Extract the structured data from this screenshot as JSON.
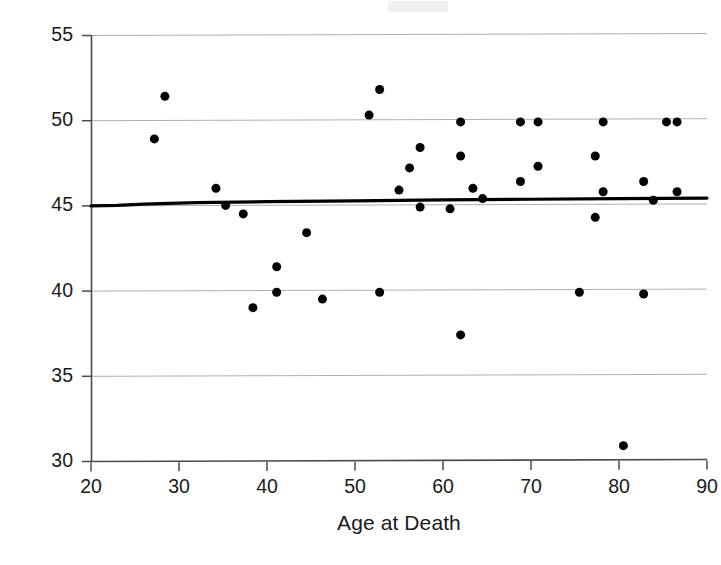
{
  "chart_data": {
    "type": "scatter",
    "title": "",
    "xlabel": "Age at Death",
    "ylabel": "Age By Cranial Suture Closure",
    "xlim": [
      20,
      90
    ],
    "ylim": [
      30,
      55
    ],
    "xticks": [
      20,
      30,
      40,
      50,
      60,
      70,
      80,
      90
    ],
    "yticks": [
      30,
      35,
      40,
      45,
      50,
      55
    ],
    "xtick_labels": [
      "20",
      "30",
      "40",
      "50",
      "60",
      "70",
      "80",
      "90"
    ],
    "ytick_labels": [
      "30",
      "35",
      "40",
      "45",
      "50",
      "55"
    ],
    "grid": "horizontal",
    "grid_color": "#b0b0b0",
    "axis_color": "#4a4a4a",
    "marker_color": "#000000",
    "marker_size": 9,
    "legend": null,
    "legend_position": "none",
    "points": [
      {
        "x": 27.2,
        "y": 48.9
      },
      {
        "x": 28.4,
        "y": 51.4
      },
      {
        "x": 34.2,
        "y": 46.0
      },
      {
        "x": 35.3,
        "y": 45.0
      },
      {
        "x": 37.3,
        "y": 44.5
      },
      {
        "x": 38.4,
        "y": 39.0
      },
      {
        "x": 41.1,
        "y": 41.4
      },
      {
        "x": 41.1,
        "y": 39.9
      },
      {
        "x": 44.5,
        "y": 43.4
      },
      {
        "x": 46.3,
        "y": 39.5
      },
      {
        "x": 51.6,
        "y": 50.3
      },
      {
        "x": 52.8,
        "y": 51.8
      },
      {
        "x": 52.8,
        "y": 39.9
      },
      {
        "x": 55.0,
        "y": 45.9
      },
      {
        "x": 56.2,
        "y": 47.2
      },
      {
        "x": 57.4,
        "y": 48.4
      },
      {
        "x": 57.4,
        "y": 44.9
      },
      {
        "x": 60.8,
        "y": 44.8
      },
      {
        "x": 62.0,
        "y": 49.9
      },
      {
        "x": 62.0,
        "y": 47.9
      },
      {
        "x": 62.0,
        "y": 37.4
      },
      {
        "x": 63.4,
        "y": 46.0
      },
      {
        "x": 64.5,
        "y": 45.4
      },
      {
        "x": 68.8,
        "y": 49.9
      },
      {
        "x": 68.8,
        "y": 46.4
      },
      {
        "x": 70.8,
        "y": 49.9
      },
      {
        "x": 70.8,
        "y": 47.3
      },
      {
        "x": 75.5,
        "y": 39.9
      },
      {
        "x": 77.3,
        "y": 47.9
      },
      {
        "x": 77.3,
        "y": 44.3
      },
      {
        "x": 78.2,
        "y": 49.9
      },
      {
        "x": 78.2,
        "y": 45.8
      },
      {
        "x": 80.5,
        "y": 30.9
      },
      {
        "x": 82.8,
        "y": 39.8
      },
      {
        "x": 82.8,
        "y": 46.4
      },
      {
        "x": 83.9,
        "y": 45.3
      },
      {
        "x": 85.4,
        "y": 49.9
      },
      {
        "x": 86.6,
        "y": 49.9
      },
      {
        "x": 86.6,
        "y": 45.8
      }
    ],
    "trend_line": {
      "style": "solid",
      "color": "#000000",
      "width": 3.2,
      "points": [
        {
          "x": 20.0,
          "y": 44.97
        },
        {
          "x": 23.0,
          "y": 45.0
        },
        {
          "x": 26.0,
          "y": 45.07
        },
        {
          "x": 32.0,
          "y": 45.16
        },
        {
          "x": 40.0,
          "y": 45.22
        },
        {
          "x": 50.0,
          "y": 45.27
        },
        {
          "x": 60.0,
          "y": 45.32
        },
        {
          "x": 70.0,
          "y": 45.36
        },
        {
          "x": 80.0,
          "y": 45.4
        },
        {
          "x": 90.0,
          "y": 45.43
        }
      ]
    }
  }
}
